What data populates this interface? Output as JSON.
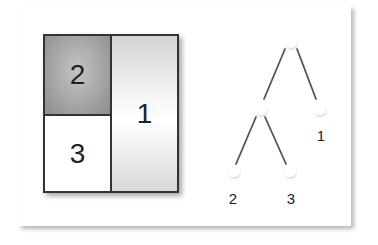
{
  "layout_diagram": {
    "regions": [
      {
        "id": "1",
        "label": "1",
        "position": "right column, full height",
        "fill": "light gray gradient"
      },
      {
        "id": "2",
        "label": "2",
        "position": "top-left",
        "fill": "dark gray gradient"
      },
      {
        "id": "3",
        "label": "3",
        "position": "bottom-left",
        "fill": "white"
      }
    ]
  },
  "tree_diagram": {
    "nodes": [
      {
        "id": "root",
        "label": "",
        "x": 291,
        "y": 43
      },
      {
        "id": "internal",
        "label": "",
        "x": 261,
        "y": 110
      },
      {
        "id": "leaf-1",
        "label": "1",
        "x": 320,
        "y": 112
      },
      {
        "id": "leaf-2",
        "label": "2",
        "x": 234,
        "y": 174
      },
      {
        "id": "leaf-3",
        "label": "3",
        "x": 289,
        "y": 174
      }
    ],
    "edges": [
      [
        "root",
        "internal"
      ],
      [
        "root",
        "leaf-1"
      ],
      [
        "internal",
        "leaf-2"
      ],
      [
        "internal",
        "leaf-3"
      ]
    ],
    "labels": {
      "leaf_1": "1",
      "leaf_2": "2",
      "leaf_3": "3"
    }
  },
  "colors": {
    "border": "#333333",
    "edge": "#555555",
    "node_shadow": "#bbbbbb"
  }
}
